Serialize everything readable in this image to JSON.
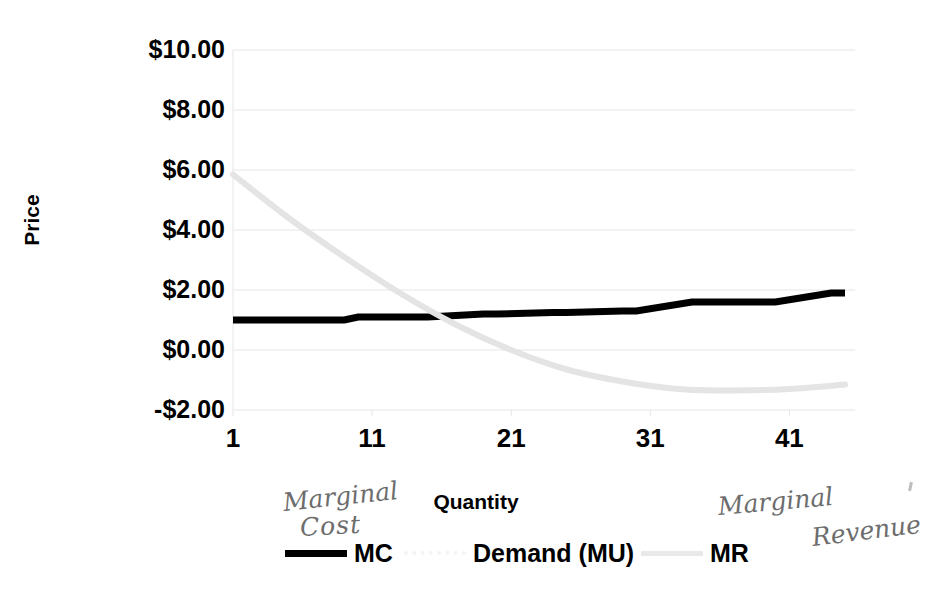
{
  "chart_data": {
    "type": "line",
    "title": "",
    "xlabel": "Quantity",
    "ylabel": "Price",
    "xlim": [
      1,
      45
    ],
    "ylim": [
      -2,
      10
    ],
    "grid": true,
    "legend_position": "bottom",
    "x_ticks": [
      "1",
      "11",
      "21",
      "31",
      "41"
    ],
    "x_tick_values": [
      1,
      11,
      21,
      31,
      41
    ],
    "y_ticks": [
      "$10.00",
      "$8.00",
      "$6.00",
      "$4.00",
      "$2.00",
      "$0.00",
      "-$2.00"
    ],
    "y_tick_values": [
      10,
      8,
      6,
      4,
      2,
      0,
      -2
    ],
    "series": [
      {
        "name": "MC",
        "label": "MC",
        "color": "#000000",
        "style": "solid-step",
        "x": [
          1,
          5,
          9,
          10,
          14,
          15,
          19,
          20,
          24,
          25,
          29,
          30,
          34,
          35,
          39,
          40,
          44,
          45
        ],
        "values": [
          1.0,
          1.0,
          1.0,
          1.1,
          1.1,
          1.1,
          1.2,
          1.2,
          1.25,
          1.25,
          1.3,
          1.3,
          1.6,
          1.6,
          1.6,
          1.6,
          1.9,
          1.9
        ]
      },
      {
        "name": "Demand (MU)",
        "label": "Demand (MU)",
        "color": "#f7f7f7",
        "style": "dotted",
        "x": [],
        "values": []
      },
      {
        "name": "MR",
        "label": "MR",
        "color": "#e4e4e4",
        "style": "smooth-curve",
        "x": [
          1,
          5,
          9,
          13,
          17,
          21,
          25,
          29,
          33,
          37,
          41,
          45
        ],
        "values": [
          5.85,
          4.4,
          3.1,
          1.9,
          0.85,
          0.0,
          -0.65,
          -1.05,
          -1.3,
          -1.35,
          -1.3,
          -1.15
        ]
      }
    ],
    "annotations": [
      {
        "text": "Marginal",
        "kind": "handwritten",
        "near": "MC legend"
      },
      {
        "text": "Cost",
        "kind": "handwritten",
        "near": "MC legend"
      },
      {
        "text": "Marginal",
        "kind": "handwritten",
        "near": "MR legend"
      },
      {
        "text": "Revenue",
        "kind": "handwritten",
        "near": "MR legend"
      }
    ]
  },
  "axes": {
    "y_title": "Price",
    "x_title": "Quantity",
    "y_tick_labels": [
      "$10.00",
      "$8.00",
      "$6.00",
      "$4.00",
      "$2.00",
      "$0.00",
      "-$2.00"
    ],
    "x_tick_labels": [
      "1",
      "11",
      "21",
      "31",
      "41"
    ]
  },
  "legend": {
    "items": [
      {
        "label": "MC",
        "color": "#000000"
      },
      {
        "label": "Demand (MU)",
        "color": "#f7f7f7"
      },
      {
        "label": "MR",
        "color": "#e4e4e4"
      }
    ]
  },
  "handwritten": {
    "mc_line1": "Marginal",
    "mc_line2": "Cost",
    "mr_line1": "Marginal",
    "mr_line2": "Revenue"
  },
  "colors": {
    "mc": "#000000",
    "mr": "#e4e4e4",
    "demand": "#f7f7f7",
    "grid": "#e6e6e6",
    "text": "#000000",
    "ink": "#6d6d6d",
    "background": "#ffffff"
  }
}
